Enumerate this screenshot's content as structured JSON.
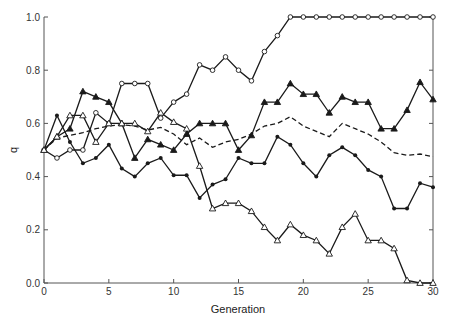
{
  "chart_data": {
    "type": "line",
    "title": "",
    "xlabel": "Generation",
    "ylabel": "q",
    "xlim": [
      0,
      30
    ],
    "ylim": [
      0.0,
      1.0
    ],
    "x_ticks": [
      "0",
      "5",
      "10",
      "15",
      "20",
      "25",
      "30"
    ],
    "y_ticks": [
      "0.0",
      "0.2",
      "0.4",
      "0.6",
      "0.8",
      "1.0"
    ],
    "grid": false,
    "legend": null,
    "x": [
      0,
      1,
      2,
      3,
      4,
      5,
      6,
      7,
      8,
      9,
      10,
      11,
      12,
      13,
      14,
      15,
      16,
      17,
      18,
      19,
      20,
      21,
      22,
      23,
      24,
      25,
      26,
      27,
      28,
      29,
      30
    ],
    "series": [
      {
        "name": "open-circle",
        "marker": "open-circle",
        "line": "solid",
        "values": [
          0.5,
          0.47,
          0.5,
          0.5,
          0.64,
          0.6,
          0.75,
          0.75,
          0.75,
          0.62,
          0.68,
          0.71,
          0.82,
          0.8,
          0.85,
          0.8,
          0.76,
          0.87,
          0.93,
          1.0,
          1.0,
          1.0,
          1.0,
          1.0,
          1.0,
          1.0,
          1.0,
          1.0,
          1.0,
          1.0,
          1.0
        ]
      },
      {
        "name": "filled-triangle",
        "marker": "filled-triangle",
        "line": "solid",
        "values": [
          0.5,
          0.55,
          0.58,
          0.72,
          0.7,
          0.68,
          0.6,
          0.47,
          0.54,
          0.52,
          0.5,
          0.56,
          0.6,
          0.6,
          0.6,
          0.5,
          0.555,
          0.68,
          0.68,
          0.75,
          0.71,
          0.71,
          0.64,
          0.7,
          0.68,
          0.68,
          0.58,
          0.58,
          0.65,
          0.755,
          0.69
        ]
      },
      {
        "name": "mean",
        "marker": "none",
        "line": "dashed",
        "values": [
          0.5,
          0.545,
          0.555,
          0.565,
          0.58,
          0.59,
          0.595,
          0.59,
          0.575,
          0.585,
          0.56,
          0.52,
          0.545,
          0.51,
          0.53,
          0.54,
          0.56,
          0.59,
          0.6,
          0.625,
          0.59,
          0.57,
          0.55,
          0.6,
          0.58,
          0.56,
          0.53,
          0.49,
          0.48,
          0.485,
          0.475
        ]
      },
      {
        "name": "filled-circle",
        "marker": "filled-circle",
        "line": "solid",
        "values": [
          0.5,
          0.63,
          0.53,
          0.45,
          0.47,
          0.52,
          0.43,
          0.4,
          0.45,
          0.47,
          0.405,
          0.405,
          0.32,
          0.37,
          0.39,
          0.47,
          0.45,
          0.45,
          0.55,
          0.52,
          0.45,
          0.4,
          0.48,
          0.51,
          0.48,
          0.425,
          0.4,
          0.28,
          0.28,
          0.375,
          0.36
        ]
      },
      {
        "name": "open-triangle",
        "marker": "open-triangle",
        "line": "solid",
        "values": [
          0.5,
          0.55,
          0.63,
          0.63,
          0.53,
          0.6,
          0.6,
          0.6,
          0.57,
          0.64,
          0.605,
          0.58,
          0.44,
          0.28,
          0.3,
          0.3,
          0.27,
          0.21,
          0.16,
          0.22,
          0.18,
          0.16,
          0.11,
          0.21,
          0.26,
          0.16,
          0.16,
          0.13,
          0.01,
          0.0,
          0.0
        ]
      }
    ]
  },
  "colors": {
    "line": "#1a1a1a",
    "axis": "#555555",
    "background": "#ffffff"
  }
}
